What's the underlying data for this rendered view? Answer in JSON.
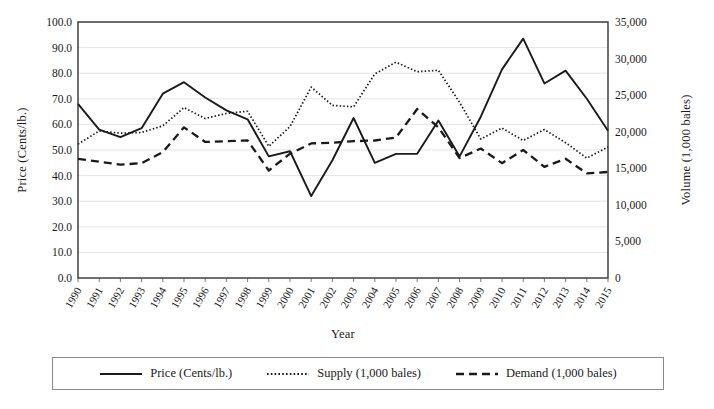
{
  "chart_data": {
    "type": "line",
    "title": "",
    "xlabel": "Year",
    "ylabel": "Price (Cents/lb.)",
    "y2label": "Volume (1,000 bales)",
    "grid": true,
    "legend_position": "bottom",
    "categories": [
      1990,
      1991,
      1992,
      1993,
      1994,
      1995,
      1996,
      1997,
      1998,
      1999,
      2000,
      2001,
      2002,
      2003,
      2004,
      2005,
      2006,
      2007,
      2008,
      2009,
      2010,
      2011,
      2012,
      2013,
      2014,
      2015
    ],
    "xtick_labels": [
      "1990",
      "1991",
      "1992",
      "1993",
      "1994",
      "1995",
      "1996",
      "1997",
      "1998",
      "1999",
      "2000",
      "2001",
      "2002",
      "2003",
      "2004",
      "2005",
      "2006",
      "2007",
      "2008",
      "2009",
      "2010",
      "2011",
      "2012",
      "2013",
      "2014",
      "2015"
    ],
    "ylim": [
      0,
      100
    ],
    "ytick_labels": [
      "0.0",
      "10.0",
      "20.0",
      "30.0",
      "40.0",
      "50.0",
      "60.0",
      "70.0",
      "80.0",
      "90.0",
      "100.0"
    ],
    "ytick_values": [
      0,
      10,
      20,
      30,
      40,
      50,
      60,
      70,
      80,
      90,
      100
    ],
    "y2lim": [
      0,
      35000
    ],
    "y2tick_labels": [
      "0",
      "5,000",
      "10,000",
      "15,000",
      "20,000",
      "25,000",
      "30,000",
      "35,000"
    ],
    "y2tick_values": [
      0,
      5000,
      10000,
      15000,
      20000,
      25000,
      30000,
      35000
    ],
    "series": [
      {
        "name": "Price (Cents/lb.)",
        "axis": "left",
        "style": "solid",
        "color": "#1a1a1a",
        "values": [
          68.0,
          58.0,
          55.0,
          58.5,
          72.0,
          76.5,
          70.5,
          65.5,
          62.0,
          47.5,
          49.5,
          32.0,
          46.0,
          62.5,
          45.0,
          48.5,
          48.5,
          61.5,
          47.5,
          63.0,
          81.5,
          93.5,
          76.0,
          81.0,
          70.0,
          57.5
        ]
      },
      {
        "name": "Supply (1,000 bales)",
        "axis": "right",
        "style": "dotted",
        "color": "#1a1a1a",
        "values": [
          18300,
          20100,
          19800,
          19900,
          20800,
          23300,
          21800,
          22500,
          22800,
          18000,
          20700,
          26100,
          23600,
          23400,
          27900,
          29500,
          28200,
          28400,
          24000,
          19000,
          20500,
          18800,
          20300,
          18500,
          16400,
          17900
        ]
      },
      {
        "name": "Demand (1,000 bales)",
        "axis": "right",
        "style": "dashed",
        "color": "#1a1a1a",
        "values": [
          16300,
          15900,
          15500,
          15700,
          17200,
          20600,
          18600,
          18700,
          18800,
          14700,
          17000,
          18400,
          18500,
          18700,
          18800,
          19200,
          23100,
          20600,
          16400,
          17700,
          15700,
          17500,
          15200,
          16300,
          14300,
          14500
        ]
      }
    ]
  },
  "legend": {
    "items": [
      {
        "label": "Price (Cents/lb.)",
        "style": "solid"
      },
      {
        "label": "Supply (1,000 bales)",
        "style": "dotted"
      },
      {
        "label": "Demand (1,000 bales)",
        "style": "dashed"
      }
    ]
  }
}
